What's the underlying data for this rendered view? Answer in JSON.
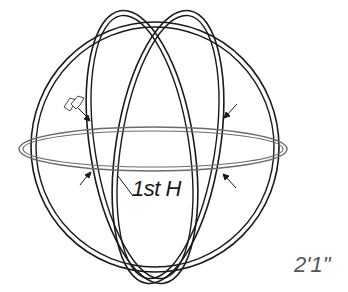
{
  "diagram": {
    "title_label": "1st H",
    "dimension_label": "2'1\"",
    "colors": {
      "stroke": "#1a1a1a",
      "ring_stroke": "#6b6b6b",
      "dimension_text": "#555555",
      "background": "#ffffff"
    },
    "elements": [
      "outer-sphere-ring",
      "meridian-ring-left",
      "meridian-ring-right",
      "equator-ring",
      "arrow-upper-left",
      "arrow-upper-right",
      "arrow-lower-left",
      "arrow-lower-right",
      "leader-line-1st-h",
      "hand-icon"
    ]
  }
}
